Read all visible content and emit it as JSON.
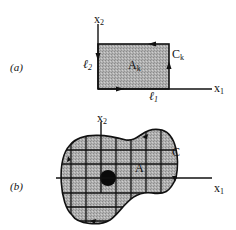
{
  "panel_a": {
    "label": "(a)",
    "axis_x": "x",
    "axis_x_sub": "1",
    "axis_y": "x",
    "axis_y_sub": "2",
    "region_label": "A",
    "region_sub": "k",
    "contour_label": "C",
    "contour_sub": "k",
    "side_horizontal": "ℓ",
    "side_horizontal_sub": "1",
    "side_vertical": "ℓ",
    "side_vertical_sub": "2"
  },
  "panel_b": {
    "label": "(b)",
    "axis_x": "x",
    "axis_x_sub": "1",
    "axis_y": "x",
    "axis_y_sub": "2",
    "region_label": "A",
    "contour_label": "C"
  },
  "colors": {
    "fill": "#a8a8a8",
    "stroke": "#111111",
    "highlight_cell": "#0a0a0a"
  }
}
